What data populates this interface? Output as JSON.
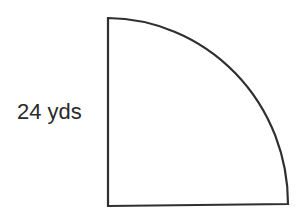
{
  "diagram": {
    "type": "quarter-circle",
    "shape_label": "quarter circle",
    "radius_label": "24 yds",
    "radius_value": 24,
    "unit": "yds",
    "stroke_color": "#2f2f2f",
    "fill_color": "#ffffff"
  }
}
